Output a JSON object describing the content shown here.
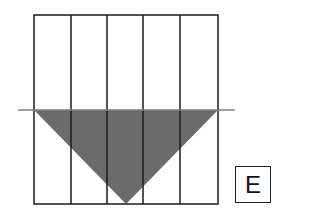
{
  "diagram": {
    "grid": {
      "columns": 5,
      "outer": {
        "x": 34,
        "y": 15,
        "width": 184,
        "height": 189
      },
      "stroke_color": "#1a1a1a"
    },
    "horizontal_line": {
      "y": 110,
      "x1": 18,
      "x2": 235,
      "color": "#808080"
    },
    "triangle": {
      "points": [
        [
          34,
          110
        ],
        [
          218,
          110
        ],
        [
          126,
          204
        ]
      ],
      "fill_color": "#6b6b6b"
    },
    "option_label": "E"
  }
}
